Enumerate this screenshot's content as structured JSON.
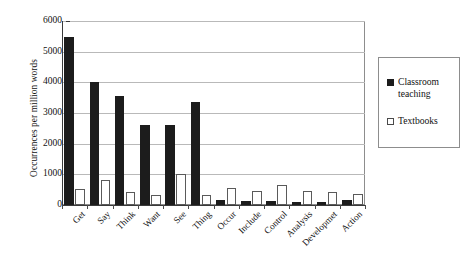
{
  "chart_data": {
    "type": "bar",
    "title": "",
    "subtitle": "",
    "xlabel": "",
    "ylabel": "Occurrences per million words",
    "ylim": [
      0,
      6000
    ],
    "yticks": [
      0,
      1000,
      2000,
      3000,
      4000,
      5000,
      6000
    ],
    "ytick_labels": [
      "0",
      "1000",
      "2000",
      "3000",
      "4000",
      "5000",
      "6000"
    ],
    "grid": "horizontal",
    "legend_position": "right-outside",
    "categories": [
      "Get",
      "Say",
      "Think",
      "Want",
      "See",
      "Thing",
      "Occur",
      "Include",
      "Control",
      "Analysis",
      "Developmet",
      "Action"
    ],
    "series": [
      {
        "name": "Classroom teaching",
        "color": "#1c1c1c",
        "fill": "solid",
        "values": [
          5480,
          4000,
          3540,
          2610,
          2620,
          3370,
          170,
          140,
          130,
          90,
          90,
          150
        ]
      },
      {
        "name": "Textbooks",
        "color": "#ffffff",
        "fill": "open",
        "values": [
          520,
          820,
          440,
          330,
          1020,
          330,
          550,
          450,
          660,
          470,
          420,
          360
        ]
      }
    ]
  },
  "legend": {
    "items": [
      {
        "label": "Classroom teaching",
        "icon": "filled-square-icon"
      },
      {
        "label": "Textbooks",
        "icon": "open-square-icon"
      }
    ]
  },
  "colors": {
    "series_classroom": "#1c1c1c",
    "series_textbooks": "#ffffff",
    "axis": "#3a3a3a",
    "grid": "#b9b9b9",
    "frame": "#8d8d8d",
    "background": "#ffffff"
  }
}
